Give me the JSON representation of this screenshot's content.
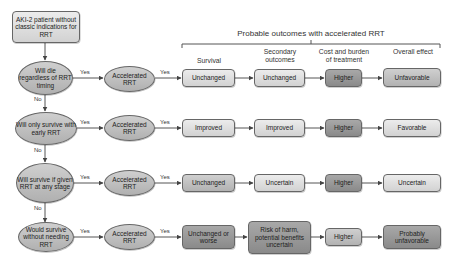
{
  "start": {
    "text": "AKI-2 patient without classic indications for RRT"
  },
  "header": {
    "title": "Probable outcomes with accelerated RRT",
    "columns": [
      "Survival",
      "Secondary outcomes",
      "Cost and burden of treatment",
      "Overall effect"
    ]
  },
  "labels": {
    "yes": "Yes",
    "no": "No"
  },
  "rows": [
    {
      "question": "Will die regardless of RRT timing",
      "action": "Accelerated RRT",
      "outcomes": [
        "Unchanged",
        "Unchanged",
        "Higher",
        "Unfavorable"
      ]
    },
    {
      "question": "Will only survive with early RRT",
      "action": "Accelerated RRT",
      "outcomes": [
        "Improved",
        "Improved",
        "Higher",
        "Favorable"
      ]
    },
    {
      "question": "Will survive if given RRT at any stage",
      "action": "Accelerated RRT",
      "outcomes": [
        "Unchanged",
        "Uncertain",
        "Higher",
        "Uncertain"
      ]
    },
    {
      "question": "Would survive without needing RRT",
      "action": "Accelerated RRT",
      "outcomes": [
        "Unchanged or worse",
        "Risk of harm, potential benefits uncertain",
        "Higher",
        "Probably unfavorable"
      ]
    }
  ],
  "colors": {
    "light": "#dcdcdc",
    "mid": "#bfbfbf",
    "dark": "#999999",
    "line": "#555555"
  }
}
